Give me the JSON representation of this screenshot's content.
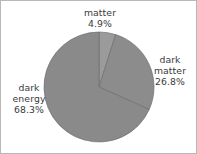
{
  "chart_data": {
    "type": "pie",
    "title": "",
    "subtitle": "",
    "xlabel": "",
    "ylabel": "",
    "legend_position": "none",
    "grid": false,
    "start_angle_deg": 90,
    "direction": "clockwise",
    "categories": [
      "matter",
      "dark matter",
      "dark energy"
    ],
    "values": [
      4.9,
      26.8,
      68.3
    ],
    "value_unit": "%",
    "slices": [
      {
        "name": "matter",
        "label_line1": "matter",
        "label_line2": "4.9%",
        "value": 4.9,
        "value_text": "4.9%",
        "color": "#9b9b9b",
        "label_position": "top"
      },
      {
        "name": "dark matter",
        "label_line1": "dark",
        "label_line2": "matter",
        "label_line3": "26.8%",
        "value": 26.8,
        "value_text": "26.8%",
        "color": "#8c8c8c",
        "label_position": "right"
      },
      {
        "name": "dark energy",
        "label_line1": "dark",
        "label_line2": "energy",
        "label_line3": "68.3%",
        "value": 68.3,
        "value_text": "68.3%",
        "color": "#8a8a8a",
        "label_position": "left"
      }
    ],
    "geometry": {
      "center_x": 98,
      "center_y": 86,
      "radius": 55
    },
    "colors": {
      "background": "#ffffff",
      "border": "#b8b8b8",
      "text": "#3a3a3a",
      "wedge_edge": "#6f6f6f"
    }
  }
}
